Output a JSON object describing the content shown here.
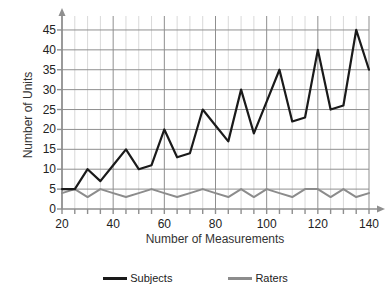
{
  "chart_data": {
    "type": "line",
    "title": "",
    "xlabel": "Number of Measurements",
    "ylabel": "Number of Units",
    "x": [
      20,
      25,
      30,
      35,
      40,
      45,
      50,
      55,
      60,
      65,
      70,
      75,
      80,
      85,
      90,
      95,
      100,
      105,
      110,
      115,
      120,
      125,
      130,
      135,
      140
    ],
    "xlim": [
      20,
      140
    ],
    "ylim": [
      0,
      47
    ],
    "xticks": [
      20,
      40,
      60,
      80,
      100,
      120,
      140
    ],
    "yticks": [
      0,
      5,
      10,
      15,
      20,
      25,
      30,
      35,
      40,
      45
    ],
    "grid": true,
    "minor_grid": true,
    "legend_position": "bottom",
    "series": [
      {
        "name": "Subjects",
        "color": "#1a1a1a",
        "values": [
          5,
          5,
          10,
          7,
          11,
          15,
          10,
          11,
          20,
          13,
          14,
          25,
          21,
          17,
          30,
          19,
          27,
          35,
          22,
          23,
          40,
          25,
          26,
          45,
          35
        ]
      },
      {
        "name": "Raters",
        "color": "#8c8c8c",
        "values": [
          4,
          5,
          3,
          5,
          4,
          3,
          4,
          5,
          4,
          3,
          4,
          5,
          4,
          3,
          5,
          3,
          5,
          4,
          3,
          5,
          5,
          3,
          5,
          3,
          4
        ]
      }
    ]
  },
  "axis": {
    "ylabel": "Number of Units",
    "xlabel": "Number of Measurements",
    "ytick_labels": [
      "0",
      "5",
      "10",
      "15",
      "20",
      "25",
      "30",
      "35",
      "40",
      "45"
    ],
    "xtick_labels": [
      "20",
      "40",
      "60",
      "80",
      "100",
      "120",
      "140"
    ]
  },
  "legend": {
    "items": [
      {
        "label": "Subjects",
        "color": "#1a1a1a"
      },
      {
        "label": "Raters",
        "color": "#8c8c8c"
      }
    ]
  },
  "colors": {
    "background": "#ffffff",
    "major_grid": "#8f8f8f",
    "minor_grid": "#d9d9d9",
    "axis": "#8f8f8f",
    "text": "#222222"
  }
}
